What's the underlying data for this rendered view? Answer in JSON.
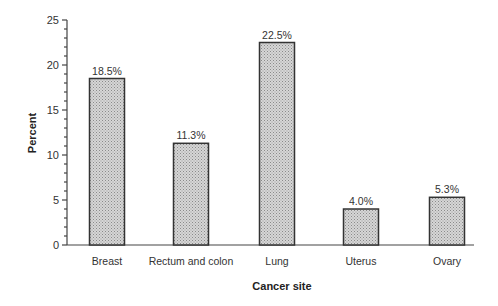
{
  "chart_data": {
    "type": "bar",
    "title": "",
    "xlabel": "Cancer site",
    "ylabel": "Percent",
    "categories": [
      "Breast",
      "Rectum and colon",
      "Lung",
      "Uterus",
      "Ovary"
    ],
    "values": [
      18.5,
      11.3,
      22.5,
      4.0,
      5.3
    ],
    "value_labels": [
      "18.5%",
      "11.3%",
      "22.5%",
      "4.0%",
      "5.3%"
    ],
    "ylim": [
      0,
      25
    ],
    "yticks": [
      0,
      5,
      10,
      15,
      20,
      25
    ],
    "minor_tick_step": 1,
    "grid": false,
    "legend": null,
    "bar_fill": "#c8c8c8",
    "bar_edge": "#333333"
  }
}
